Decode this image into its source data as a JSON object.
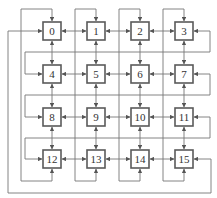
{
  "diagram": {
    "type": "4x4 mesh network with wraparound links",
    "nodes": [
      {
        "id": "0",
        "label": "0",
        "row": 0,
        "col": 0
      },
      {
        "id": "1",
        "label": "1",
        "row": 0,
        "col": 1
      },
      {
        "id": "2",
        "label": "2",
        "row": 0,
        "col": 2
      },
      {
        "id": "3",
        "label": "3",
        "row": 0,
        "col": 3
      },
      {
        "id": "4",
        "label": "4",
        "row": 1,
        "col": 0
      },
      {
        "id": "5",
        "label": "5",
        "row": 1,
        "col": 1
      },
      {
        "id": "6",
        "label": "6",
        "row": 1,
        "col": 2
      },
      {
        "id": "7",
        "label": "7",
        "row": 1,
        "col": 3
      },
      {
        "id": "8",
        "label": "8",
        "row": 2,
        "col": 0
      },
      {
        "id": "9",
        "label": "9",
        "row": 2,
        "col": 1
      },
      {
        "id": "10",
        "label": "10",
        "row": 2,
        "col": 2
      },
      {
        "id": "11",
        "label": "11",
        "row": 2,
        "col": 3
      },
      {
        "id": "12",
        "label": "12",
        "row": 3,
        "col": 0
      },
      {
        "id": "13",
        "label": "13",
        "row": 3,
        "col": 1
      },
      {
        "id": "14",
        "label": "14",
        "row": 3,
        "col": 2
      },
      {
        "id": "15",
        "label": "15",
        "row": 3,
        "col": 3
      }
    ],
    "edges": {
      "horizontal_bidirectional": [
        [
          "0",
          "1"
        ],
        [
          "1",
          "2"
        ],
        [
          "2",
          "3"
        ],
        [
          "4",
          "5"
        ],
        [
          "5",
          "6"
        ],
        [
          "6",
          "7"
        ],
        [
          "8",
          "9"
        ],
        [
          "9",
          "10"
        ],
        [
          "10",
          "11"
        ],
        [
          "12",
          "13"
        ],
        [
          "13",
          "14"
        ],
        [
          "14",
          "15"
        ]
      ],
      "vertical_bidirectional": [
        [
          "0",
          "4"
        ],
        [
          "4",
          "8"
        ],
        [
          "8",
          "12"
        ],
        [
          "1",
          "5"
        ],
        [
          "5",
          "9"
        ],
        [
          "9",
          "13"
        ],
        [
          "2",
          "6"
        ],
        [
          "6",
          "10"
        ],
        [
          "10",
          "14"
        ],
        [
          "3",
          "7"
        ],
        [
          "7",
          "11"
        ],
        [
          "11",
          "15"
        ]
      ],
      "column_wrap": [
        [
          "12",
          "0"
        ],
        [
          "13",
          "1"
        ],
        [
          "14",
          "2"
        ],
        [
          "15",
          "3"
        ]
      ],
      "row_wrap": [
        [
          "3",
          "4"
        ],
        [
          "7",
          "8"
        ],
        [
          "11",
          "12"
        ],
        [
          "15",
          "0"
        ]
      ]
    },
    "colors": {
      "box_stroke": "#5a5a5a",
      "wire": "#777777",
      "background": "#ffffff"
    }
  }
}
